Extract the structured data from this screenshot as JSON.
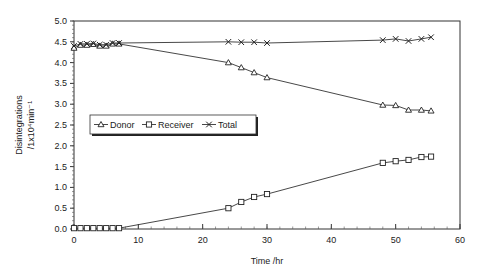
{
  "chart_data": {
    "type": "line",
    "title": "",
    "xlabel": "Time /hr",
    "ylabel_line1": "Disintegrations",
    "ylabel_line2": "/1x10⁴min⁻¹",
    "xlim": [
      0,
      60
    ],
    "ylim": [
      0,
      5.0
    ],
    "x_ticks": [
      0,
      10,
      20,
      30,
      40,
      50,
      60
    ],
    "y_ticks": [
      "0.0",
      "0.5",
      "1.0",
      "1.5",
      "2.0",
      "2.5",
      "3.0",
      "3.5",
      "4.0",
      "4.5",
      "5.0"
    ],
    "grid": false,
    "legend_position": "inside-middle-left",
    "series": [
      {
        "name": "Donor",
        "marker": "triangle",
        "x": [
          0,
          1,
          2,
          3,
          4,
          5,
          6,
          7,
          24,
          26,
          28,
          30,
          48,
          50,
          52,
          54,
          55.5
        ],
        "values": [
          4.35,
          4.42,
          4.42,
          4.44,
          4.4,
          4.4,
          4.45,
          4.45,
          4.0,
          3.88,
          3.76,
          3.64,
          2.98,
          2.97,
          2.86,
          2.86,
          2.84
        ]
      },
      {
        "name": "Receiver",
        "marker": "square",
        "x": [
          0,
          1,
          2,
          3,
          4,
          5,
          6,
          7,
          24,
          26,
          28,
          30,
          48,
          50,
          52,
          54,
          55.5
        ],
        "values": [
          0.02,
          0.02,
          0.02,
          0.02,
          0.02,
          0.02,
          0.02,
          0.02,
          0.5,
          0.65,
          0.77,
          0.84,
          1.59,
          1.63,
          1.66,
          1.73,
          1.74
        ]
      },
      {
        "name": "Total",
        "marker": "x",
        "x": [
          0,
          1,
          2,
          3,
          4,
          5,
          6,
          7,
          24,
          26,
          28,
          30,
          48,
          50,
          52,
          54,
          55.5
        ],
        "values": [
          4.4,
          4.45,
          4.45,
          4.46,
          4.43,
          4.43,
          4.47,
          4.47,
          4.5,
          4.49,
          4.49,
          4.47,
          4.54,
          4.57,
          4.52,
          4.57,
          4.61
        ]
      }
    ]
  }
}
